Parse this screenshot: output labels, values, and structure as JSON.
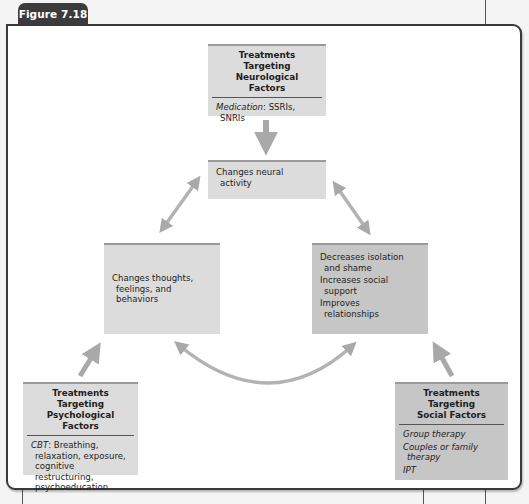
{
  "figure": {
    "label": "Figure 7.18"
  },
  "colors": {
    "tab": "#3b3b3b",
    "frame_border": "#3a3a3a",
    "box_light": "#dcdcdc",
    "box_dark": "#c6c6c6",
    "arrow": "#a9a9a9"
  },
  "boxes": {
    "neurological": {
      "title_line1": "Treatments Targeting",
      "title_line2": "Neurological Factors",
      "body_prefix": "Medication",
      "body_rest": ": SSRIs, SNRIs"
    },
    "neural_activity": {
      "text": "Changes neural activity"
    },
    "thoughts": {
      "text": "Changes thoughts, feelings, and behaviors"
    },
    "social_outcomes": {
      "items": [
        "Decreases isolation and shame",
        "Increases social support",
        "Improves relationships"
      ]
    },
    "psychological": {
      "title_line1": "Treatments Targeting",
      "title_line2": "Psychological Factors",
      "body_prefix": "CBT",
      "body_rest": ": Breathing, relaxation, exposure, cognitive restructuring, psychoeducation"
    },
    "social": {
      "title_line1": "Treatments Targeting",
      "title_line2": "Social Factors",
      "items": [
        "Group therapy",
        "Couples or family therapy",
        "IPT"
      ]
    }
  },
  "arrows": [
    {
      "from": "neurological",
      "to": "neural_activity",
      "type": "single"
    },
    {
      "from": "neural_activity",
      "to": "thoughts",
      "type": "double"
    },
    {
      "from": "neural_activity",
      "to": "social_outcomes",
      "type": "double"
    },
    {
      "from": "thoughts",
      "to": "social_outcomes",
      "type": "double-curved"
    },
    {
      "from": "psychological",
      "to": "thoughts",
      "type": "single"
    },
    {
      "from": "social",
      "to": "social_outcomes",
      "type": "single"
    }
  ]
}
